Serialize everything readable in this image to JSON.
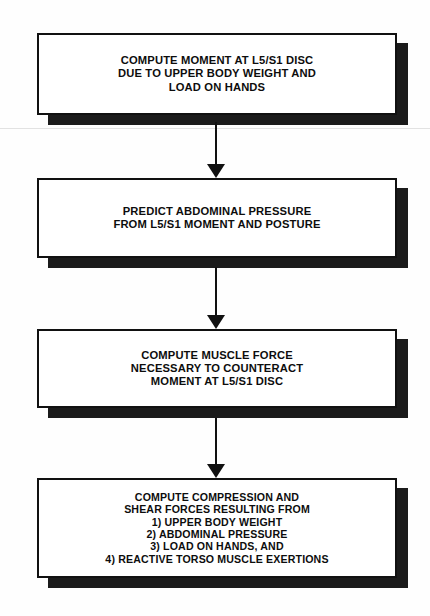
{
  "diagram": {
    "type": "flowchart",
    "orientation": "vertical",
    "colors": {
      "box_fill": "#ffffff",
      "box_border": "#111111",
      "shadow": "#1b1b1b",
      "text": "#0d0d0d",
      "background": "#fefefe"
    },
    "nodes": [
      {
        "id": "node-1",
        "text": "COMPUTE MOMENT AT L5/S1 DISC\nDUE TO UPPER BODY WEIGHT AND\nLOAD ON HANDS",
        "lines": [
          "COMPUTE MOMENT AT L5/S1 DISC",
          "DUE TO UPPER BODY WEIGHT AND",
          "LOAD ON HANDS"
        ]
      },
      {
        "id": "node-2",
        "text": "PREDICT ABDOMINAL PRESSURE\nFROM L5/S1 MOMENT AND POSTURE",
        "lines": [
          "PREDICT ABDOMINAL PRESSURE",
          "FROM L5/S1 MOMENT AND POSTURE"
        ]
      },
      {
        "id": "node-3",
        "text": "COMPUTE MUSCLE FORCE\nNECESSARY TO COUNTERACT\nMOMENT AT L5/S1 DISC",
        "lines": [
          "COMPUTE MUSCLE FORCE",
          "NECESSARY TO COUNTERACT",
          "MOMENT AT L5/S1 DISC"
        ]
      },
      {
        "id": "node-4",
        "text": "COMPUTE COMPRESSION AND\nSHEAR FORCES RESULTING FROM\n1) UPPER BODY WEIGHT\n2) ABDOMINAL PRESSURE\n3) LOAD ON HANDS, AND\n4) REACTIVE TORSO MUSCLE EXERTIONS",
        "lines": [
          "COMPUTE COMPRESSION AND",
          "SHEAR FORCES RESULTING FROM",
          "1) UPPER BODY WEIGHT",
          "2) ABDOMINAL PRESSURE",
          "3) LOAD ON HANDS, AND",
          "4) REACTIVE TORSO MUSCLE EXERTIONS"
        ]
      }
    ],
    "edges": [
      {
        "id": "edge-1-2",
        "from": "node-1",
        "to": "node-2",
        "arrow": "down"
      },
      {
        "id": "edge-2-3",
        "from": "node-2",
        "to": "node-3",
        "arrow": "down"
      },
      {
        "id": "edge-3-4",
        "from": "node-3",
        "to": "node-4",
        "arrow": "down"
      }
    ]
  }
}
